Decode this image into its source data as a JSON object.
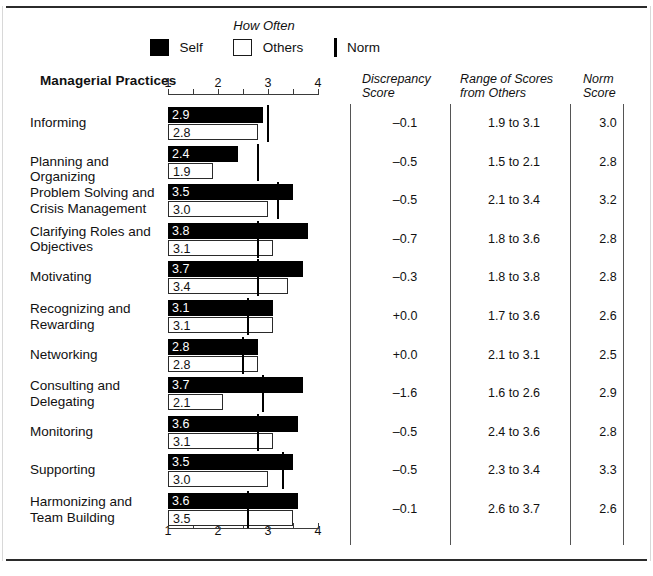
{
  "legend": {
    "title": "How Often",
    "items": [
      {
        "key": "self",
        "label": "Self"
      },
      {
        "key": "others",
        "label": "Others"
      },
      {
        "key": "norm",
        "label": "Norm"
      }
    ]
  },
  "headers": {
    "practices": "Managerial Practices",
    "discrepancy_l1": "Discrepancy",
    "discrepancy_l2": "Score",
    "range_l1": "Range of Scores",
    "range_l2": "from Others",
    "norm_l1": "Norm",
    "norm_l2": "Score"
  },
  "axis": {
    "ticks": [
      "1",
      "2",
      "3",
      "4"
    ],
    "min": 1,
    "max": 4
  },
  "colors": {
    "self": "#000000",
    "others": "#ffffff",
    "outline": "#2a2a2a",
    "norm": "#000000",
    "rule": "#2b2b2b"
  },
  "chart_data": {
    "type": "bar",
    "title": "How Often",
    "xlabel": "",
    "ylabel": "Managerial Practices",
    "xlim": [
      1,
      4
    ],
    "grid": false,
    "legend_position": "top",
    "categories": [
      "Informing",
      "Planning and Organizing",
      "Problem Solving and Crisis Management",
      "Clarifying Roles and Objectives",
      "Motivating",
      "Recognizing and Rewarding",
      "Networking",
      "Consulting and Delegating",
      "Monitoring",
      "Supporting",
      "Harmonizing and Team Building"
    ],
    "series": [
      {
        "name": "Self",
        "values": [
          2.9,
          2.4,
          3.5,
          3.8,
          3.7,
          3.1,
          2.8,
          3.7,
          3.6,
          3.5,
          3.6
        ]
      },
      {
        "name": "Others",
        "values": [
          2.8,
          1.9,
          3.0,
          3.1,
          3.4,
          3.1,
          2.8,
          2.1,
          3.1,
          3.0,
          3.5
        ]
      },
      {
        "name": "Norm",
        "values": [
          3.0,
          2.8,
          3.2,
          2.8,
          2.8,
          2.6,
          2.5,
          2.9,
          2.8,
          3.3,
          2.6
        ]
      }
    ]
  },
  "rows": [
    {
      "label_l1": "Informing",
      "label_l2": "",
      "self": "2.9",
      "others": "2.8",
      "self_v": 2.9,
      "others_v": 2.8,
      "norm_v": 3.0,
      "discrepancy": "–0.1",
      "range": "1.9 to 3.1",
      "norm": "3.0"
    },
    {
      "label_l1": "Planning and Organizing",
      "label_l2": "",
      "self": "2.4",
      "others": "1.9",
      "self_v": 2.4,
      "others_v": 1.9,
      "norm_v": 2.8,
      "discrepancy": "–0.5",
      "range": "1.5 to 2.1",
      "norm": "2.8"
    },
    {
      "label_l1": "Problem Solving and",
      "label_l2": "Crisis Management",
      "self": "3.5",
      "others": "3.0",
      "self_v": 3.5,
      "others_v": 3.0,
      "norm_v": 3.2,
      "discrepancy": "–0.5",
      "range": "2.1 to 3.4",
      "norm": "3.2"
    },
    {
      "label_l1": "Clarifying Roles and",
      "label_l2": "Objectives",
      "self": "3.8",
      "others": "3.1",
      "self_v": 3.8,
      "others_v": 3.1,
      "norm_v": 2.8,
      "discrepancy": "–0.7",
      "range": "1.8 to 3.6",
      "norm": "2.8"
    },
    {
      "label_l1": "Motivating",
      "label_l2": "",
      "self": "3.7",
      "others": "3.4",
      "self_v": 3.7,
      "others_v": 3.4,
      "norm_v": 2.8,
      "discrepancy": "–0.3",
      "range": "1.8 to 3.8",
      "norm": "2.8"
    },
    {
      "label_l1": "Recognizing and",
      "label_l2": "Rewarding",
      "self": "3.1",
      "others": "3.1",
      "self_v": 3.1,
      "others_v": 3.1,
      "norm_v": 2.6,
      "discrepancy": "+0.0",
      "range": "1.7 to 3.6",
      "norm": "2.6"
    },
    {
      "label_l1": "Networking",
      "label_l2": "",
      "self": "2.8",
      "others": "2.8",
      "self_v": 2.8,
      "others_v": 2.8,
      "norm_v": 2.5,
      "discrepancy": "+0.0",
      "range": "2.1 to 3.1",
      "norm": "2.5"
    },
    {
      "label_l1": "Consulting and",
      "label_l2": "Delegating",
      "self": "3.7",
      "others": "2.1",
      "self_v": 3.7,
      "others_v": 2.1,
      "norm_v": 2.9,
      "discrepancy": "–1.6",
      "range": "1.6 to 2.6",
      "norm": "2.9"
    },
    {
      "label_l1": "Monitoring",
      "label_l2": "",
      "self": "3.6",
      "others": "3.1",
      "self_v": 3.6,
      "others_v": 3.1,
      "norm_v": 2.8,
      "discrepancy": "–0.5",
      "range": "2.4 to 3.6",
      "norm": "2.8"
    },
    {
      "label_l1": "Supporting",
      "label_l2": "",
      "self": "3.5",
      "others": "3.0",
      "self_v": 3.5,
      "others_v": 3.0,
      "norm_v": 3.3,
      "discrepancy": "–0.5",
      "range": "2.3 to 3.4",
      "norm": "3.3"
    },
    {
      "label_l1": "Harmonizing and",
      "label_l2": "Team Building",
      "self": "3.6",
      "others": "3.5",
      "self_v": 3.6,
      "others_v": 3.5,
      "norm_v": 2.6,
      "discrepancy": "–0.1",
      "range": "2.6 to 3.7",
      "norm": "2.6"
    }
  ]
}
